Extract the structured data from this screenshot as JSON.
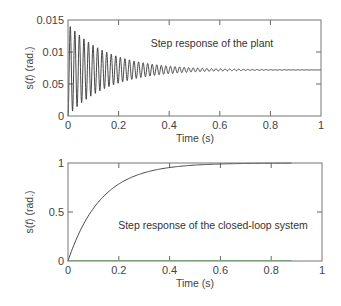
{
  "chart_data": [
    {
      "type": "line",
      "title": "",
      "annotation": "Step response of the plant",
      "xlabel": "Time (s)",
      "ylabel_prefix": "s(",
      "ylabel_italic": "t",
      "ylabel_suffix": ") (rad.)",
      "xlim": [
        0,
        1
      ],
      "ylim": [
        0,
        0.015
      ],
      "xticks": [
        0,
        0.2,
        0.4,
        0.6,
        0.8,
        1
      ],
      "xtick_labels": [
        "0",
        "0.2",
        "0.4",
        "0.6",
        "0.8",
        "1"
      ],
      "yticks": [
        0,
        0.005,
        0.01,
        0.015
      ],
      "ytick_labels": [
        "0",
        "0.05",
        "0.01",
        "0.015"
      ],
      "grid": false,
      "series": [
        {
          "name": "plant step response",
          "model": "damped oscillation",
          "steady_state": 0.0072,
          "initial_value": 0,
          "first_peak": 0.0136,
          "oscillation_period_s": 0.018,
          "decay_time_constant_s": 0.16,
          "t_end": 1,
          "color": "#333333"
        }
      ]
    },
    {
      "type": "line",
      "title": "",
      "annotation": "Step response of the closed-loop system",
      "xlabel": "Time (s)",
      "ylabel_prefix": "s(",
      "ylabel_italic": "t",
      "ylabel_suffix": ") (rad.)",
      "xlim": [
        0,
        1
      ],
      "ylim": [
        0,
        1
      ],
      "xticks": [
        0,
        0.2,
        0.4,
        0.6,
        0.8,
        1
      ],
      "xtick_labels": [
        "0",
        "0.2",
        "0.4",
        "0.6",
        "0.8",
        "1"
      ],
      "yticks": [
        0,
        0.5,
        1
      ],
      "ytick_labels": [
        "0",
        "0.5",
        "1"
      ],
      "grid": false,
      "series": [
        {
          "name": "closed-loop step response",
          "model": "first-order rise",
          "final_value": 1,
          "time_constant_s": 0.13,
          "t_end": 0.88,
          "points": [
            [
              0,
              0
            ],
            [
              0.05,
              0.32
            ],
            [
              0.1,
              0.54
            ],
            [
              0.15,
              0.68
            ],
            [
              0.2,
              0.78
            ],
            [
              0.3,
              0.89
            ],
            [
              0.4,
              0.94
            ],
            [
              0.5,
              0.97
            ],
            [
              0.6,
              0.985
            ],
            [
              0.7,
              0.993
            ],
            [
              0.88,
              1.0
            ]
          ],
          "color": "#333333"
        },
        {
          "name": "baseline",
          "points": [
            [
              0,
              0
            ],
            [
              0.88,
              0
            ]
          ],
          "color": "#7fc98a"
        }
      ]
    }
  ]
}
